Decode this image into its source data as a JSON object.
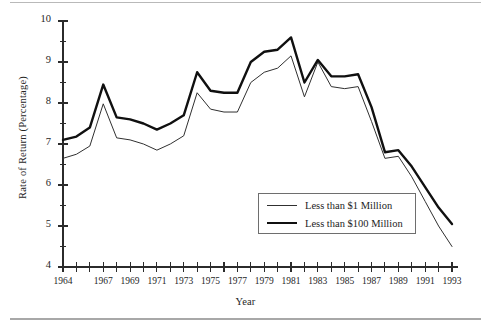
{
  "figure": {
    "xlabel": "Year",
    "ylabel": "Rate of Return (Percentage)"
  },
  "legend": {
    "entries": [
      {
        "label": "Less than $1 Million",
        "style": "thin"
      },
      {
        "label": "Less than $100 Million",
        "style": "thick"
      }
    ]
  },
  "chart_data": {
    "type": "line",
    "title": "",
    "xlabel": "Year",
    "ylabel": "Rate of Return (Percentage)",
    "xlim": [
      1964,
      1993
    ],
    "ylim": [
      4,
      10
    ],
    "yticks": [
      4,
      5,
      6,
      7,
      8,
      9,
      10
    ],
    "yticks_minor": [
      4.5,
      5.5,
      6.5,
      7.5,
      8.5,
      9.5
    ],
    "ytick_labels": [
      "4",
      "5",
      "6",
      "7",
      "8",
      "9",
      "10"
    ],
    "xticks": [
      1964,
      1965,
      1966,
      1967,
      1968,
      1969,
      1970,
      1971,
      1972,
      1973,
      1974,
      1975,
      1976,
      1977,
      1978,
      1979,
      1980,
      1981,
      1982,
      1983,
      1984,
      1985,
      1986,
      1987,
      1988,
      1989,
      1990,
      1991,
      1992,
      1993
    ],
    "xtick_labels_shown": [
      "1964",
      "1967",
      "1969",
      "1971",
      "1973",
      "1975",
      "1977",
      "1979",
      "1981",
      "1983",
      "1985",
      "1987",
      "1989",
      "1991",
      "1993"
    ],
    "grid": false,
    "legend_position": "lower-center-right",
    "x": [
      1964,
      1965,
      1966,
      1967,
      1968,
      1969,
      1970,
      1971,
      1972,
      1973,
      1974,
      1975,
      1976,
      1977,
      1978,
      1979,
      1980,
      1981,
      1982,
      1983,
      1984,
      1985,
      1986,
      1987,
      1988,
      1989,
      1990,
      1991,
      1992,
      1993
    ],
    "series": [
      {
        "name": "Less than $1 Million",
        "style": "thin",
        "color": "#303030",
        "values": [
          6.65,
          6.75,
          6.95,
          7.98,
          7.15,
          7.1,
          7.0,
          6.85,
          7.0,
          7.2,
          8.25,
          7.85,
          7.78,
          7.78,
          8.5,
          8.75,
          8.85,
          9.15,
          8.15,
          9.0,
          8.4,
          8.35,
          8.4,
          7.55,
          6.65,
          6.7,
          6.2,
          5.6,
          5.0,
          4.5
        ]
      },
      {
        "name": "Less than $100 Million",
        "style": "thick",
        "color": "#101010",
        "values": [
          7.1,
          7.18,
          7.4,
          8.45,
          7.65,
          7.6,
          7.5,
          7.35,
          7.5,
          7.7,
          8.75,
          8.3,
          8.25,
          8.25,
          9.0,
          9.25,
          9.3,
          9.6,
          8.5,
          9.05,
          8.65,
          8.65,
          8.7,
          7.9,
          6.8,
          6.85,
          6.45,
          5.95,
          5.45,
          5.05
        ]
      }
    ]
  }
}
